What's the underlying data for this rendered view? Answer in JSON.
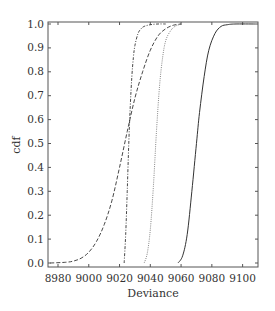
{
  "chart_data": {
    "type": "line",
    "title": "",
    "xlabel": "Deviance",
    "ylabel": "cdf",
    "xlim": [
      8973.5,
      9110
    ],
    "ylim": [
      0.0,
      1.0
    ],
    "grid": false,
    "legend": null,
    "xticks": [
      8980,
      9000,
      9020,
      9040,
      9060,
      9080,
      9100
    ],
    "xtick_labels": [
      "8980",
      "9000",
      "9020",
      "9040",
      "9060",
      "9080",
      "9100"
    ],
    "yticks": [
      0.0,
      0.1,
      0.2,
      0.3,
      0.4,
      0.5,
      0.6,
      0.7,
      0.8,
      0.9,
      1.0
    ],
    "ytick_labels": [
      "0.0",
      "0.1",
      "0.2",
      "0.3",
      "0.4",
      "0.5",
      "0.6",
      "0.7",
      "0.8",
      "0.9",
      "1.0"
    ],
    "series": [
      {
        "name": "wide (long dashed)",
        "style": "dashed",
        "dash": "4,2",
        "x": [
          8975,
          8985,
          8990,
          8995,
          9000,
          9005,
          9010,
          9015,
          9020,
          9025,
          9030,
          9035,
          9040,
          9045,
          9050,
          9055,
          9060
        ],
        "y": [
          0.0,
          0.003,
          0.008,
          0.02,
          0.045,
          0.09,
          0.16,
          0.26,
          0.4,
          0.55,
          0.69,
          0.8,
          0.89,
          0.95,
          0.98,
          0.995,
          1.0
        ]
      },
      {
        "name": "steep (dash-dot)",
        "style": "dashdot",
        "dash": "3,1.5,1,1.5",
        "x": [
          9023,
          9024,
          9025,
          9026,
          9027,
          9028,
          9029,
          9030,
          9032,
          9034,
          9036,
          9040,
          9045,
          9050
        ],
        "y": [
          0.0,
          0.12,
          0.3,
          0.5,
          0.66,
          0.78,
          0.86,
          0.91,
          0.96,
          0.98,
          0.99,
          0.997,
          1.0,
          1.0
        ]
      },
      {
        "name": "dotted",
        "style": "dotted",
        "dash": "1,1.2",
        "x": [
          9036,
          9038,
          9040,
          9042,
          9044,
          9046,
          9048,
          9050,
          9053,
          9056,
          9060
        ],
        "y": [
          0.0,
          0.04,
          0.14,
          0.32,
          0.55,
          0.74,
          0.86,
          0.93,
          0.97,
          0.99,
          1.0
        ]
      },
      {
        "name": "solid",
        "style": "solid",
        "dash": "",
        "x": [
          9058,
          9061,
          9064,
          9067,
          9070,
          9072,
          9075,
          9078,
          9082,
          9086,
          9090,
          9095,
          9108
        ],
        "y": [
          0.0,
          0.03,
          0.12,
          0.3,
          0.5,
          0.63,
          0.78,
          0.89,
          0.96,
          0.99,
          0.997,
          1.0,
          1.0
        ]
      }
    ]
  },
  "layout": {
    "plot_left": 48,
    "plot_right": 258,
    "plot_top": 22,
    "plot_bottom": 267,
    "y0_px": 263,
    "y1_px": 24,
    "axis_color": "#555555",
    "line_color": "#333333",
    "dotted_color": "#777777"
  }
}
